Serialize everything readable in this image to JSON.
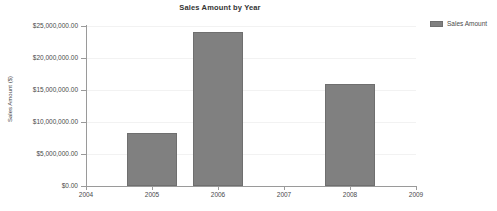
{
  "chart_data": {
    "type": "bar",
    "title": "Sales Amount by Year",
    "xlabel": "",
    "ylabel": "Sales Amount ($)",
    "categories": [
      "2004",
      "2005",
      "2006",
      "2007",
      "2008",
      "2009"
    ],
    "values": [
      0,
      8300000,
      24100000,
      0,
      16000000,
      0
    ],
    "series": [
      {
        "name": "Sales Amount",
        "values": [
          0,
          8300000,
          24100000,
          0,
          16000000,
          0
        ]
      }
    ],
    "ylim": [
      0,
      25000000
    ],
    "ytick_values": [
      0,
      5000000,
      10000000,
      15000000,
      20000000,
      25000000
    ],
    "ytick_labels": [
      "$0.00",
      "$5,000,000.00",
      "$10,000,000.00",
      "$15,000,000.00",
      "$20,000,000.00",
      "$25,000,000.00"
    ],
    "xtick_labels": [
      "2004",
      "2005",
      "2006",
      "2007",
      "2008",
      "2009"
    ],
    "grid": true,
    "legend": {
      "position": "right",
      "entries": [
        {
          "label": "Sales Amount",
          "color": "#808080"
        }
      ]
    },
    "colors": {
      "bar_fill": "#808080",
      "bar_border": "#6f6f6f",
      "gridline": "#f2f2f2",
      "axis": "#9a9a9a",
      "text": "#4a4a4a",
      "background": "#ffffff"
    }
  }
}
